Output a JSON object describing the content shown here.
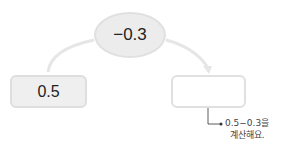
{
  "diagram": {
    "operation": "−0.3",
    "start_value": "0.5",
    "result_value": "",
    "hint": {
      "line1": "0.5−0.3을",
      "line2": "계산해요."
    }
  },
  "colors": {
    "ellipse_fill": "#ececec",
    "box_fill": "#efefef",
    "border": "#e0e0e0",
    "arrow": "#e6e6e6",
    "hint_line": "#333333"
  }
}
